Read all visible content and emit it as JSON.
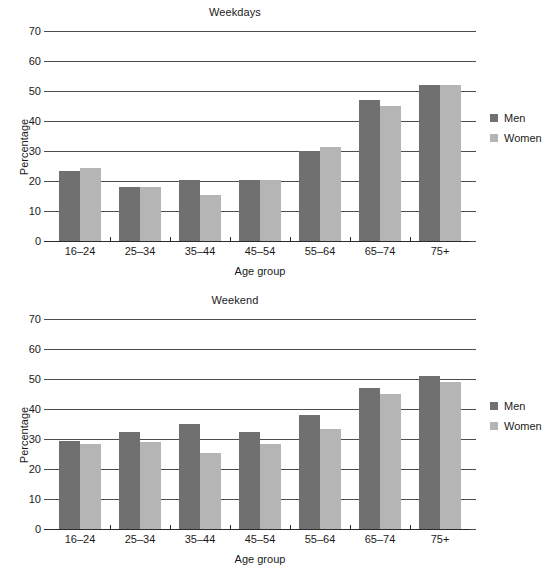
{
  "figure": {
    "background": "#ffffff",
    "men_color": "#707070",
    "women_color": "#b5b5b5"
  },
  "legend": {
    "men_label": "Men",
    "women_label": "Women"
  },
  "axis": {
    "y_title": "Percentage",
    "x_title": "Age group",
    "y_ticks": [
      "70",
      "60",
      "50",
      "40",
      "30",
      "20",
      "10",
      "0"
    ],
    "x_ticks": [
      "16–24",
      "25–34",
      "35–44",
      "45–54",
      "55–64",
      "65–74",
      "75+"
    ]
  },
  "charts": [
    {
      "title": "Weekdays",
      "men": [
        23.5,
        18.0,
        20.5,
        20.5,
        30.0,
        47.0,
        52.0
      ],
      "women": [
        24.5,
        18.0,
        15.5,
        20.5,
        31.5,
        45.0,
        52.0
      ]
    },
    {
      "title": "Weekend",
      "men": [
        29.5,
        32.5,
        35.0,
        32.5,
        38.0,
        47.0,
        51.0
      ],
      "women": [
        28.5,
        29.0,
        25.5,
        28.5,
        33.5,
        45.0,
        49.0
      ]
    }
  ],
  "chart_data": [
    {
      "type": "bar",
      "title": "Weekdays",
      "xlabel": "Age group",
      "ylabel": "Percentage",
      "ylim": [
        0,
        70
      ],
      "yticks": [
        0,
        10,
        20,
        30,
        40,
        50,
        60,
        70
      ],
      "grid": true,
      "legend_position": "right",
      "categories": [
        "16–24",
        "25–34",
        "35–44",
        "45–54",
        "55–64",
        "65–74",
        "75+"
      ],
      "series": [
        {
          "name": "Men",
          "values": [
            23.5,
            18.0,
            20.5,
            20.5,
            30.0,
            47.0,
            52.0
          ]
        },
        {
          "name": "Women",
          "values": [
            24.5,
            18.0,
            15.5,
            20.5,
            31.5,
            45.0,
            52.0
          ]
        }
      ]
    },
    {
      "type": "bar",
      "title": "Weekend",
      "xlabel": "Age group",
      "ylabel": "Percentage",
      "ylim": [
        0,
        70
      ],
      "yticks": [
        0,
        10,
        20,
        30,
        40,
        50,
        60,
        70
      ],
      "grid": true,
      "legend_position": "right",
      "categories": [
        "16–24",
        "25–34",
        "35–44",
        "45–54",
        "55–64",
        "65–74",
        "75+"
      ],
      "series": [
        {
          "name": "Men",
          "values": [
            29.5,
            32.5,
            35.0,
            32.5,
            38.0,
            47.0,
            51.0
          ]
        },
        {
          "name": "Women",
          "values": [
            28.5,
            29.0,
            25.5,
            28.5,
            33.5,
            45.0,
            49.0
          ]
        }
      ]
    }
  ]
}
